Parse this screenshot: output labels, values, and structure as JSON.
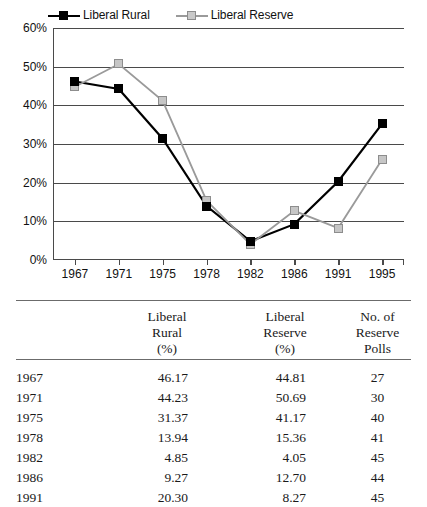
{
  "chart_data": {
    "type": "line",
    "title": "",
    "xlabel": "",
    "ylabel": "",
    "categories": [
      "1967",
      "1971",
      "1975",
      "1978",
      "1982",
      "1986",
      "1991",
      "1995"
    ],
    "ylim": [
      0,
      60
    ],
    "yticks": [
      "0%",
      "10%",
      "20%",
      "30%",
      "40%",
      "50%",
      "60%"
    ],
    "ytick_values": [
      0,
      10,
      20,
      30,
      40,
      50,
      60
    ],
    "grid": true,
    "legend_position": "top-left",
    "series": [
      {
        "name": "Liberal Rural",
        "color": "#000000",
        "marker": "filled-square",
        "values": [
          46.17,
          44.23,
          31.37,
          13.94,
          4.85,
          9.27,
          20.3,
          35.2
        ]
      },
      {
        "name": "Liberal Reserve",
        "color": "#9a9a9a",
        "marker": "open-square",
        "values": [
          44.81,
          50.69,
          41.17,
          15.36,
          4.05,
          12.7,
          8.27,
          26.0
        ]
      }
    ]
  },
  "legend": {
    "entries": [
      {
        "label": "Liberal Rural"
      },
      {
        "label": "Liberal Reserve"
      }
    ]
  },
  "table": {
    "headers": {
      "year": "",
      "rural": {
        "line1": "Liberal",
        "line2": "Rural",
        "line3": "(%)"
      },
      "reserve": {
        "line1": "Liberal",
        "line2": "Reserve",
        "line3": "(%)"
      },
      "polls": {
        "line1": "No. of",
        "line2": "Reserve",
        "line3": "Polls"
      }
    },
    "rows": [
      {
        "year": "1967",
        "rural": "46.17",
        "reserve": "44.81",
        "polls": "27"
      },
      {
        "year": "1971",
        "rural": "44.23",
        "reserve": "50.69",
        "polls": "30"
      },
      {
        "year": "1975",
        "rural": "31.37",
        "reserve": "41.17",
        "polls": "40"
      },
      {
        "year": "1978",
        "rural": "13.94",
        "reserve": "15.36",
        "polls": "41"
      },
      {
        "year": "1982",
        "rural": "4.85",
        "reserve": "4.05",
        "polls": "45"
      },
      {
        "year": "1986",
        "rural": "9.27",
        "reserve": "12.70",
        "polls": "44"
      },
      {
        "year": "1991",
        "rural": "20.30",
        "reserve": "8.27",
        "polls": "45"
      }
    ]
  },
  "colors": {
    "rural": "#000000",
    "reserve": "#9a9a9a",
    "axis": "#4a4a4a",
    "rule": "#6b6b6b"
  }
}
